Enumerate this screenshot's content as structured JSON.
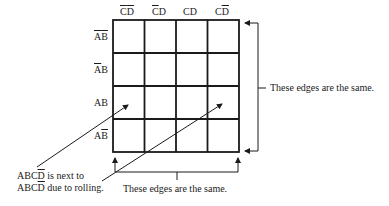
{
  "kmap": {
    "columns": [
      {
        "parts": [
          {
            "t": "C",
            "bar": true
          },
          {
            "t": "D",
            "bar": true
          }
        ]
      },
      {
        "parts": [
          {
            "t": "C",
            "bar": true
          },
          {
            "t": "D",
            "bar": false
          }
        ]
      },
      {
        "parts": [
          {
            "t": "C",
            "bar": false
          },
          {
            "t": "D",
            "bar": false
          }
        ]
      },
      {
        "parts": [
          {
            "t": "C",
            "bar": false
          },
          {
            "t": "D",
            "bar": true
          }
        ]
      }
    ],
    "rows": [
      {
        "parts": [
          {
            "t": "A",
            "bar": true
          },
          {
            "t": "B",
            "bar": true
          }
        ]
      },
      {
        "parts": [
          {
            "t": "A",
            "bar": true
          },
          {
            "t": "B",
            "bar": false
          }
        ]
      },
      {
        "parts": [
          {
            "t": "A",
            "bar": false
          },
          {
            "t": "B",
            "bar": false
          }
        ]
      },
      {
        "parts": [
          {
            "t": "A",
            "bar": false
          },
          {
            "t": "B",
            "bar": true
          }
        ]
      }
    ],
    "grid_rows": 4,
    "grid_cols": 4
  },
  "annotations": {
    "right_bracket": "These edges are the same.",
    "bottom_bracket": "These edges are the same.",
    "rolling_line1_prefix": "ABC",
    "rolling_line1_suffix": " is next to",
    "rolling_line2_prefix": "ABC",
    "rolling_line2_suffix": " due to rolling."
  },
  "colors": {
    "line": "#1a1a1a",
    "background": "#ffffff"
  }
}
